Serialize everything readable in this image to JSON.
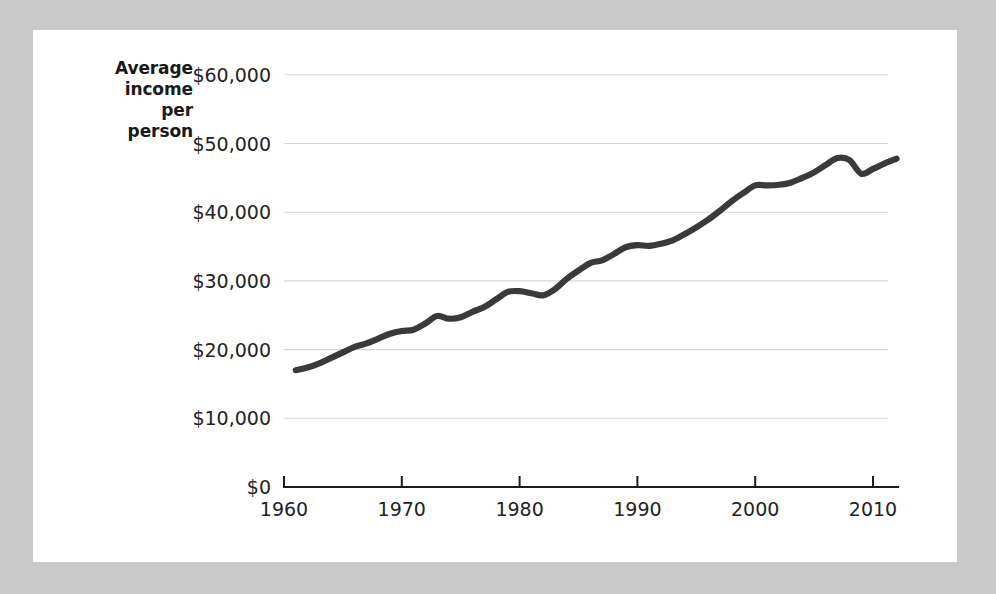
{
  "figure": {
    "background_color": "#c9c9c9",
    "card_color": "#ffffff",
    "axis_title_lines": [
      "Average",
      "income",
      "per",
      "person"
    ]
  },
  "chart_data": {
    "type": "line",
    "title": "",
    "subtitle": "",
    "xlabel": "",
    "ylabel": "Average income per person",
    "xlim": [
      1960,
      2012
    ],
    "ylim": [
      0,
      62000
    ],
    "grid": true,
    "grid_axis": "y",
    "legend": false,
    "legend_position": "none",
    "line_color": "#3a3a3a",
    "line_width": 6.2,
    "y_ticks": [
      0,
      10000,
      20000,
      30000,
      40000,
      50000,
      60000
    ],
    "y_tick_labels": [
      "$0",
      "$10,000",
      "$20,000",
      "$30,000",
      "$40,000",
      "$50,000",
      "$60,000"
    ],
    "x_ticks": [
      1960,
      1970,
      1980,
      1990,
      2000,
      2010
    ],
    "x_tick_labels": [
      "1960",
      "1970",
      "1980",
      "1990",
      "2000",
      "2010"
    ],
    "series": [
      {
        "name": "Average income per person",
        "x": [
          1961,
          1962,
          1963,
          1964,
          1965,
          1966,
          1967,
          1968,
          1969,
          1970,
          1971,
          1972,
          1973,
          1974,
          1975,
          1976,
          1977,
          1978,
          1979,
          1980,
          1981,
          1982,
          1983,
          1984,
          1985,
          1986,
          1987,
          1988,
          1989,
          1990,
          1991,
          1992,
          1993,
          1994,
          1995,
          1996,
          1997,
          1998,
          1999,
          2000,
          2001,
          2002,
          2003,
          2004,
          2005,
          2006,
          2007,
          2008,
          2009,
          2010,
          2011,
          2012
        ],
        "values": [
          17000,
          17400,
          18000,
          18800,
          19600,
          20400,
          20900,
          21600,
          22300,
          22700,
          22900,
          23800,
          24900,
          24500,
          24700,
          25500,
          26200,
          27300,
          28400,
          28500,
          28200,
          27900,
          28800,
          30300,
          31500,
          32600,
          33000,
          33900,
          34900,
          35200,
          35100,
          35400,
          35900,
          36800,
          37800,
          38900,
          40200,
          41600,
          42800,
          43900,
          43900,
          44000,
          44300,
          45000,
          45800,
          46900,
          47900,
          47600,
          45600,
          46300,
          47100,
          47800
        ]
      }
    ]
  }
}
